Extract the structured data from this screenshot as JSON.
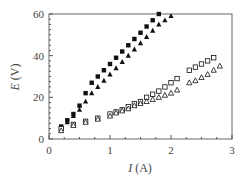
{
  "chart_data": {
    "type": "scatter",
    "title": "",
    "xlabel": "I (A)",
    "xlabel_var": "I",
    "xlabel_unit": "(A)",
    "ylabel": "E (V)",
    "ylabel_var": "E",
    "ylabel_unit": "(V)",
    "xlim": [
      0,
      3
    ],
    "ylim": [
      0,
      60
    ],
    "xticks": [
      0,
      1,
      2,
      3
    ],
    "yticks": [
      0,
      20,
      40,
      60
    ],
    "xtick_labels": [
      "0",
      "1",
      "2",
      "3"
    ],
    "ytick_labels": [
      "0",
      "20",
      "40",
      "60"
    ],
    "grid": false,
    "legend": null,
    "series": [
      {
        "name": "filled squares",
        "marker": "square-filled",
        "x": [
          0.2,
          0.3,
          0.4,
          0.5,
          0.6,
          0.7,
          0.8,
          0.9,
          1.0,
          1.1,
          1.2,
          1.3,
          1.4,
          1.5,
          1.6,
          1.7,
          1.8
        ],
        "y": [
          6,
          9,
          12,
          16,
          22,
          27,
          30,
          33,
          36,
          39,
          42,
          45,
          48,
          51,
          54,
          57,
          60
        ]
      },
      {
        "name": "filled triangles",
        "marker": "triangle-filled",
        "x": [
          0.2,
          0.3,
          0.4,
          0.5,
          0.6,
          0.7,
          0.8,
          0.9,
          1.0,
          1.1,
          1.2,
          1.3,
          1.4,
          1.5,
          1.6,
          1.7,
          1.8,
          1.9,
          2.0
        ],
        "y": [
          5,
          8,
          11,
          14,
          18,
          22,
          25,
          28,
          31,
          34,
          37,
          40,
          43,
          46,
          49,
          52,
          55,
          57,
          59
        ]
      },
      {
        "name": "open squares",
        "marker": "square-open",
        "x": [
          0.2,
          0.4,
          0.6,
          0.8,
          1.0,
          1.1,
          1.2,
          1.3,
          1.4,
          1.5,
          1.6,
          1.7,
          1.8,
          1.9,
          2.0,
          2.1,
          2.3,
          2.4,
          2.5,
          2.6,
          2.7
        ],
        "y": [
          5,
          7,
          8.5,
          10,
          12,
          13,
          14,
          15.5,
          17,
          18,
          20,
          21.5,
          23,
          25,
          27,
          29,
          33,
          34.5,
          36,
          37.5,
          39
        ]
      },
      {
        "name": "open triangles",
        "marker": "triangle-open",
        "x": [
          0.2,
          0.4,
          0.6,
          0.8,
          1.0,
          1.1,
          1.2,
          1.3,
          1.4,
          1.5,
          1.6,
          1.7,
          1.8,
          1.9,
          2.0,
          2.1,
          2.3,
          2.4,
          2.5,
          2.6,
          2.7,
          2.8
        ],
        "y": [
          4,
          6.5,
          8,
          9.5,
          11,
          12.5,
          13.5,
          14.5,
          16,
          17,
          18,
          19,
          20,
          21,
          22,
          23.5,
          27,
          28,
          29.5,
          31,
          33,
          35
        ]
      }
    ]
  },
  "colors": {
    "axis": "#555555",
    "marker": "#111111",
    "text": "#444444",
    "background": "#ffffff"
  }
}
